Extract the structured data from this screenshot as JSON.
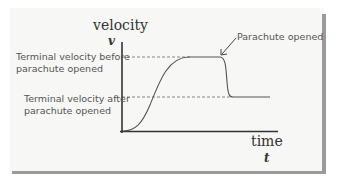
{
  "diagram": {
    "y_axis_title": "velocity",
    "y_axis_symbol": "v",
    "x_axis_title": "time",
    "x_axis_symbol": "t",
    "labels": {
      "terminal_before_line1": "Terminal velocity before",
      "terminal_before_line2": "parachute opened",
      "terminal_after_line1": "Terminal velocity after",
      "terminal_after_line2": "parachute opened",
      "parachute_opened": "Parachute opened"
    },
    "colors": {
      "curve": "#555555",
      "axes": "#333333",
      "dashed": "#777777",
      "label_text": "#555555",
      "panel": "#f7f7f5",
      "shadow": "#9a9a9a"
    }
  }
}
